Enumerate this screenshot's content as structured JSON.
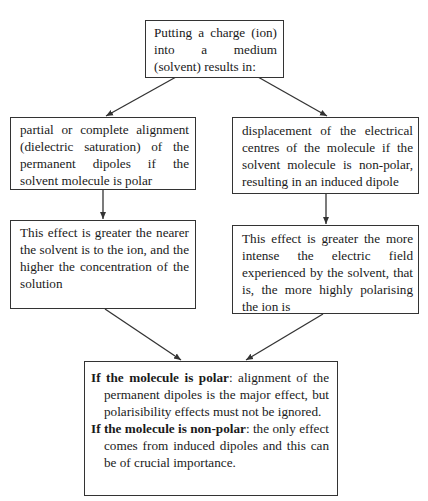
{
  "diagram": {
    "top_box": "Putting a charge (ion) into a medium (solvent) results in:",
    "left_effect": "partial or complete alignment (dielectric saturation) of the permanent dipoles if the solvent molecule is polar",
    "right_effect": "displacement of the electrical centres of the molecule if the solvent molecule is non-polar, resulting in an induced dipole",
    "left_condition": "This effect is greater the nearer the solvent is to the ion, and the higher the concentration of the solution",
    "right_condition": "This effect is greater the more intense the electric field experienced by the solvent, that is, the more highly polarising the ion is",
    "conclusion": {
      "polar_label": "If the molecule is polar",
      "polar_text": ": alignment of the permanent dipoles is the major effect, but polarisibility effects must not be ignored.",
      "nonpolar_label": "If the molecule is non-polar",
      "nonpolar_text": ": the only effect comes from induced dipoles and this can be of crucial importance."
    }
  },
  "colors": {
    "line": "#333333",
    "text": "#1a1a1a",
    "background": "#ffffff"
  }
}
